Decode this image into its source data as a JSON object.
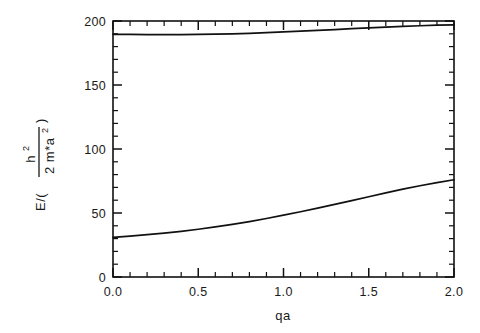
{
  "figure": {
    "background_color": "#ffffff",
    "ink_color": "#111111"
  },
  "chart_data": {
    "type": "line",
    "title": "",
    "subtitle": "",
    "xlabel": "qa",
    "ylabel": "E / ( h² / 2m*a² )",
    "ylabel_parts": {
      "prefix": "E/(",
      "numerator": "h",
      "numerator_sup": "2",
      "denominator": "2 m*a",
      "denominator_sup": "2",
      "suffix": ")"
    },
    "xlim": [
      0.0,
      2.0
    ],
    "ylim": [
      0,
      200
    ],
    "grid": false,
    "legend": "none",
    "x_major_ticks": [
      0.0,
      0.5,
      1.0,
      1.5,
      2.0
    ],
    "x_major_tick_labels": [
      "0.0",
      "0.5",
      "1.0",
      "1.5",
      "2.0"
    ],
    "x_minor_tick_step": 0.1,
    "y_major_ticks": [
      0,
      50,
      100,
      150,
      200
    ],
    "y_major_tick_labels": [
      "0",
      "50",
      "100",
      "150",
      "200"
    ],
    "y_minor_tick_step": 10,
    "ticks_direction": "inward",
    "ticks_on_all_sides": true,
    "series": [
      {
        "name": "upper-band",
        "x": [
          0.0,
          0.1,
          0.2,
          0.3,
          0.4,
          0.5,
          0.6,
          0.7,
          0.8,
          0.9,
          1.0,
          1.1,
          1.2,
          1.3,
          1.4,
          1.5,
          1.6,
          1.7,
          1.8,
          1.9,
          2.0
        ],
        "values": [
          189.6,
          189.5,
          189.4,
          189.4,
          189.4,
          189.5,
          189.7,
          190.0,
          190.4,
          190.9,
          191.5,
          192.1,
          192.7,
          193.3,
          194.0,
          194.6,
          195.2,
          195.8,
          196.3,
          196.7,
          197.0
        ]
      },
      {
        "name": "lower-band",
        "x": [
          0.0,
          0.1,
          0.2,
          0.3,
          0.4,
          0.5,
          0.6,
          0.7,
          0.8,
          0.9,
          1.0,
          1.1,
          1.2,
          1.3,
          1.4,
          1.5,
          1.6,
          1.7,
          1.8,
          1.9,
          2.0
        ],
        "values": [
          31.0,
          32.0,
          33.1,
          34.3,
          35.7,
          37.3,
          39.1,
          41.1,
          43.3,
          45.7,
          48.3,
          51.0,
          53.8,
          56.7,
          59.7,
          62.7,
          65.7,
          68.6,
          71.3,
          73.8,
          76.0
        ]
      }
    ]
  }
}
